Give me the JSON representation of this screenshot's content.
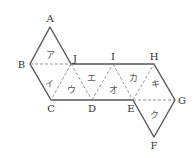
{
  "diagram": {
    "vertices": [
      {
        "id": "A",
        "label": "A",
        "x": 50,
        "y": 27,
        "lx": 50,
        "ly": 22,
        "anchor": "middle"
      },
      {
        "id": "B",
        "label": "B",
        "x": 30,
        "y": 64,
        "lx": 25,
        "ly": 68,
        "anchor": "end"
      },
      {
        "id": "J",
        "label": "J",
        "x": 71,
        "y": 64,
        "lx": 73,
        "ly": 62,
        "anchor": "start"
      },
      {
        "id": "C",
        "label": "C",
        "x": 51,
        "y": 100,
        "lx": 51,
        "ly": 112,
        "anchor": "middle"
      },
      {
        "id": "D",
        "label": "D",
        "x": 92,
        "y": 100,
        "lx": 92,
        "ly": 112,
        "anchor": "middle"
      },
      {
        "id": "I",
        "label": "I",
        "x": 113,
        "y": 64,
        "lx": 113,
        "ly": 60,
        "anchor": "middle"
      },
      {
        "id": "H",
        "label": "H",
        "x": 154,
        "y": 64,
        "lx": 154,
        "ly": 60,
        "anchor": "middle"
      },
      {
        "id": "E",
        "label": "E",
        "x": 133,
        "y": 100,
        "lx": 131,
        "ly": 112,
        "anchor": "middle"
      },
      {
        "id": "G",
        "label": "G",
        "x": 175,
        "y": 100,
        "lx": 178,
        "ly": 104,
        "anchor": "start"
      },
      {
        "id": "F",
        "label": "F",
        "x": 154,
        "y": 137,
        "lx": 154,
        "ly": 149,
        "anchor": "middle"
      }
    ],
    "faces": [
      {
        "label": "ア",
        "x": 50,
        "y": 55
      },
      {
        "label": "イ",
        "x": 49,
        "y": 84
      },
      {
        "label": "ウ",
        "x": 71,
        "y": 90
      },
      {
        "label": "エ",
        "x": 91,
        "y": 78
      },
      {
        "label": "オ",
        "x": 113,
        "y": 90
      },
      {
        "label": "カ",
        "x": 133,
        "y": 78
      },
      {
        "label": "キ",
        "x": 155,
        "y": 84
      },
      {
        "label": "ク",
        "x": 154,
        "y": 115
      }
    ],
    "solid_edges": "A-J, J-H, H-G, G-F, F-E, E-C, C-B, B-A",
    "dashed_edges": "B-J, J-C, J-D, D-I, I-E, E-H, E-G"
  }
}
